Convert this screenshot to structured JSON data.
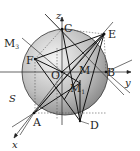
{
  "diagram": {
    "type": "3d-sphere-geometry",
    "axes": {
      "x": "x",
      "y": "y",
      "z": "z"
    },
    "surface_label": "S",
    "points": [
      {
        "name": "C",
        "label": "C"
      },
      {
        "name": "E",
        "label": "E"
      },
      {
        "name": "B",
        "label": "B"
      },
      {
        "name": "F",
        "label": "F"
      },
      {
        "name": "O",
        "label": "O"
      },
      {
        "name": "A",
        "label": "A"
      },
      {
        "name": "D",
        "label": "D"
      },
      {
        "name": "M",
        "label": "M"
      },
      {
        "name": "M1",
        "label": "M",
        "sub": "1"
      },
      {
        "name": "M3",
        "label": "M",
        "sub": "3"
      }
    ],
    "colors": {
      "sphere_light": "#f2f2f2",
      "sphere_dark": "#8a8a8a",
      "line": "#1a1a1a",
      "dashed": "#555555"
    }
  }
}
